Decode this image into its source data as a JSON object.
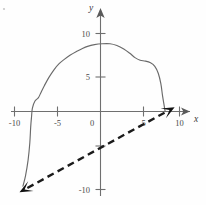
{
  "chart_data": {
    "type": "line",
    "title": "",
    "xlabel": "x",
    "ylabel": "y",
    "xlim": [
      -11.5,
      11.5
    ],
    "ylim": [
      -11.5,
      11.5
    ],
    "grid": false,
    "legend": null,
    "x_ticks": [
      -10,
      -5,
      0,
      5,
      10
    ],
    "x_tick_labels": [
      "-10",
      "-5",
      "0",
      "5",
      "10"
    ],
    "y_ticks": [
      -10,
      -5,
      5,
      10
    ],
    "y_tick_labels": [
      "-10",
      "",
      "5",
      "10"
    ],
    "origin_label": "0",
    "series": [
      {
        "name": "solid-curve",
        "style": "solid",
        "color": "#6a6a6a",
        "points": [
          [
            -9.0,
            -8.6
          ],
          [
            -8.7,
            -7.4
          ],
          [
            -8.4,
            -5.6
          ],
          [
            -8.2,
            -3.6
          ],
          [
            -8.1,
            -1.8
          ],
          [
            -8.0,
            -0.6
          ],
          [
            -7.9,
            0.4
          ],
          [
            -7.6,
            1.2
          ],
          [
            -7.2,
            1.6
          ],
          [
            -6.9,
            2.2
          ],
          [
            -6.5,
            3.0
          ],
          [
            -6.0,
            3.9
          ],
          [
            -5.4,
            4.8
          ],
          [
            -4.8,
            5.5
          ],
          [
            -4.2,
            6.0
          ],
          [
            -3.5,
            6.5
          ],
          [
            -2.8,
            6.9
          ],
          [
            -2.2,
            7.2
          ],
          [
            -1.5,
            7.5
          ],
          [
            -0.7,
            7.7
          ],
          [
            0.2,
            7.8
          ],
          [
            1.1,
            7.8
          ],
          [
            1.9,
            7.6
          ],
          [
            2.7,
            7.2
          ],
          [
            3.4,
            6.7
          ],
          [
            4.0,
            6.2
          ],
          [
            4.6,
            5.9
          ],
          [
            5.2,
            5.8
          ],
          [
            5.8,
            5.6
          ],
          [
            6.3,
            5.2
          ],
          [
            6.7,
            4.4
          ],
          [
            7.0,
            3.2
          ],
          [
            7.2,
            1.8
          ],
          [
            7.4,
            0.6
          ],
          [
            7.5,
            0.0
          ]
        ]
      },
      {
        "name": "dashed-asymptote",
        "style": "dashed",
        "color": "#1b1b1b",
        "points": [
          [
            -9.4,
            -9.3
          ],
          [
            8.6,
            0.5
          ]
        ],
        "arrows": [
          "start",
          "end"
        ]
      }
    ]
  },
  "axes": {
    "x_axis_name": "x",
    "y_axis_name": "y",
    "x_arrow": "right-arrow-icon",
    "y_arrow": "up-arrow-icon"
  }
}
